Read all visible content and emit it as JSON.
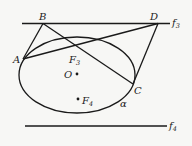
{
  "diagram": {
    "type": "geometry",
    "lines": [
      {
        "name": "f3",
        "label": "f",
        "sub": "3"
      },
      {
        "name": "f4",
        "label": "f",
        "sub": "4"
      }
    ],
    "points": {
      "A": "A",
      "B": "B",
      "C": "C",
      "D": "D",
      "O": "O",
      "F3": {
        "label": "F",
        "sub": "3"
      },
      "F4": {
        "label": "F",
        "sub": "4"
      }
    },
    "curve_label": "α",
    "colors": {
      "stroke": "#1a1a1a",
      "background": "#f7f7f5"
    }
  }
}
